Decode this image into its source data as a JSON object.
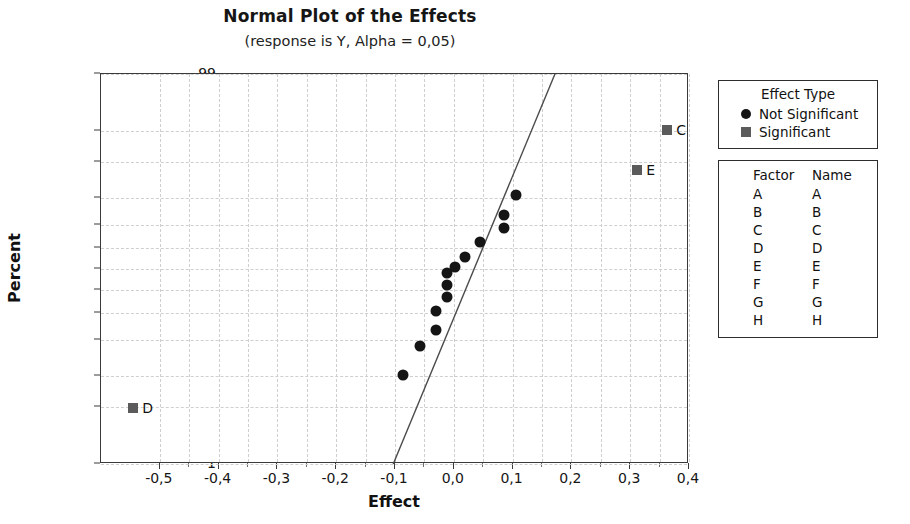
{
  "chart_data": {
    "type": "scatter",
    "title": "Normal Plot of the Effects",
    "subtitle": "(response is Y, Alpha = 0,05)",
    "xlabel": "Effect",
    "ylabel": "Percent",
    "xlim": [
      -0.6,
      0.4
    ],
    "ylim_percent": [
      1,
      99
    ],
    "grid": true,
    "x_ticks": [
      "-0,5",
      "-0,4",
      "-0,3",
      "-0,2",
      "-0,1",
      "0,0",
      "0,1",
      "0,2",
      "0,3",
      "0,4"
    ],
    "x_tick_values": [
      -0.5,
      -0.4,
      -0.3,
      -0.2,
      -0.1,
      0.0,
      0.1,
      0.2,
      0.3,
      0.4
    ],
    "y_ticks": [
      "99",
      "95",
      "90",
      "80",
      "70",
      "60",
      "50",
      "40",
      "30",
      "20",
      "10",
      "5",
      "1"
    ],
    "y_tick_values": [
      99,
      95,
      90,
      80,
      70,
      60,
      50,
      40,
      30,
      20,
      10,
      5,
      1
    ],
    "series": [
      {
        "name": "Not Significant",
        "marker": "circle",
        "color": "#151515",
        "points": [
          {
            "effect": -0.086,
            "percent": 10.3,
            "label": ""
          },
          {
            "effect": -0.058,
            "percent": 17.9,
            "label": ""
          },
          {
            "effect": -0.03,
            "percent": 23.4,
            "label": ""
          },
          {
            "effect": -0.03,
            "percent": 30.8,
            "label": ""
          },
          {
            "effect": -0.012,
            "percent": 36.9,
            "label": ""
          },
          {
            "effect": -0.012,
            "percent": 42.6,
            "label": ""
          },
          {
            "effect": -0.012,
            "percent": 48.1,
            "label": ""
          },
          {
            "effect": 0.002,
            "percent": 50.9,
            "label": ""
          },
          {
            "effect": 0.019,
            "percent": 55.8,
            "label": ""
          },
          {
            "effect": 0.044,
            "percent": 62.6,
            "label": ""
          },
          {
            "effect": 0.086,
            "percent": 68.6,
            "label": ""
          },
          {
            "effect": 0.086,
            "percent": 74.2,
            "label": ""
          },
          {
            "effect": 0.105,
            "percent": 81.2,
            "label": ""
          }
        ]
      },
      {
        "name": "Significant",
        "marker": "square",
        "color": "#5b5b5b",
        "points": [
          {
            "effect": -0.545,
            "percent": 4.9,
            "label": "D"
          },
          {
            "effect": 0.312,
            "percent": 88.1,
            "label": "E"
          },
          {
            "effect": 0.363,
            "percent": 95.1,
            "label": "C"
          }
        ]
      }
    ],
    "fit_line": {
      "x_start": -0.103,
      "y_start_percent": 1.0,
      "x_end": 0.172,
      "y_end_percent": 99.0
    }
  },
  "legend_effect_type": {
    "title": "Effect Type",
    "entries": [
      {
        "marker": "circle",
        "label": "Not Significant"
      },
      {
        "marker": "square",
        "label": "Significant"
      }
    ]
  },
  "legend_factors": {
    "headers": [
      "Factor",
      "Name"
    ],
    "rows": [
      {
        "factor": "A",
        "name": "A"
      },
      {
        "factor": "B",
        "name": "B"
      },
      {
        "factor": "C",
        "name": "C"
      },
      {
        "factor": "D",
        "name": "D"
      },
      {
        "factor": "E",
        "name": "E"
      },
      {
        "factor": "F",
        "name": "F"
      },
      {
        "factor": "G",
        "name": "G"
      },
      {
        "factor": "H",
        "name": "H"
      }
    ]
  }
}
